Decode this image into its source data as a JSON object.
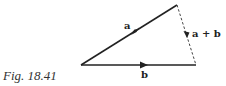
{
  "figure": {
    "caption": "Fig. 18.41",
    "vectors": [
      {
        "id": "a",
        "label": "a",
        "style": "solid",
        "from": [
          177,
          5
        ],
        "to": [
          81,
          65
        ]
      },
      {
        "id": "b",
        "label": "b",
        "style": "solid",
        "from": [
          81,
          65
        ],
        "to": [
          196,
          65
        ]
      },
      {
        "id": "a_plus_b",
        "label": "a + b",
        "style": "dashed",
        "from": [
          177,
          5
        ],
        "to": [
          196,
          65
        ]
      }
    ],
    "colors": {
      "line": "#222222",
      "background": "#ffffff"
    }
  }
}
